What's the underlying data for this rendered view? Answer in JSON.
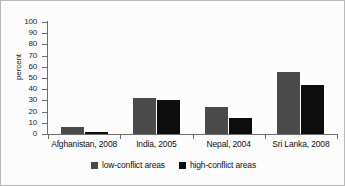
{
  "chart_data": {
    "type": "bar",
    "title": "",
    "xlabel": "",
    "ylabel": "percent",
    "ylim": [
      0,
      100
    ],
    "ytick_step": 10,
    "yticks": [
      100,
      90,
      80,
      70,
      60,
      50,
      40,
      30,
      20,
      10,
      0
    ],
    "grid": false,
    "legend_position": "bottom",
    "categories": [
      "Afghanistan, 2008",
      "India, 2005",
      "Nepal, 2004",
      "Sri Lanka, 2008"
    ],
    "series": [
      {
        "name": "low-conflict areas",
        "color": "#4a4a4a",
        "values": [
          6,
          32,
          24,
          55
        ]
      },
      {
        "name": "high-conflict areas",
        "color": "#0d0d0d",
        "values": [
          2,
          30,
          14,
          44
        ]
      }
    ]
  },
  "axis": {
    "y_title": "percent"
  },
  "legend": {
    "items": [
      {
        "label": "low-conflict areas",
        "color": "#4a4a4a"
      },
      {
        "label": "high-conflict areas",
        "color": "#0d0d0d"
      }
    ]
  }
}
